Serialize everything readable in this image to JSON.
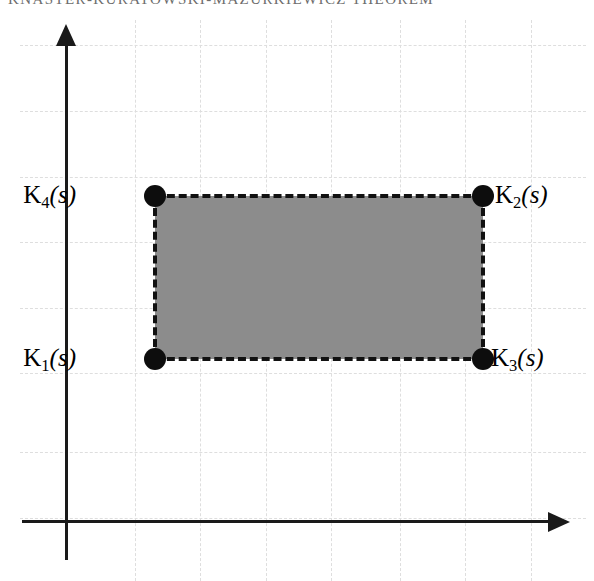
{
  "header": {
    "text": "KNASTER-KURATOWSKI-MAZURKIEWICZ THEOREM"
  },
  "figure": {
    "type": "math-diagram",
    "axes": {
      "x_axis_name": "x-axis",
      "y_axis_name": "y-axis",
      "origin_px": [
        66,
        521
      ],
      "x_arrow_direction": "right",
      "y_arrow_direction": "up",
      "tick_labels": []
    },
    "grid": {
      "visible": true,
      "style": "dashed",
      "color": "#dedede",
      "spacing_px": 65.5,
      "vertical_positions_px": [
        135,
        200,
        266,
        331,
        400,
        465,
        531
      ],
      "horizontal_positions_px": [
        45,
        111,
        177,
        242,
        308,
        373,
        452,
        518
      ]
    },
    "region": {
      "name": "shaded-rectangle",
      "fill_color": "#8c8c8c",
      "border_style": "dashed",
      "border_color": "#111111",
      "x_px": 155,
      "y_px": 196,
      "width_px": 328,
      "height_px": 163
    },
    "vertices": [
      {
        "id": "K1",
        "base": "K",
        "subscript": "1",
        "argument": "(s)",
        "corner": "bottom-left",
        "x_px": 155,
        "y_px": 359,
        "label_x_px": 76,
        "label_y_px": 345,
        "label_align": "right"
      },
      {
        "id": "K2",
        "base": "K",
        "subscript": "2",
        "argument": "(s)",
        "corner": "top-right",
        "x_px": 483,
        "y_px": 196,
        "label_x_px": 495,
        "label_y_px": 182,
        "label_align": "left"
      },
      {
        "id": "K3",
        "base": "K",
        "subscript": "3",
        "argument": "(s)",
        "corner": "bottom-right",
        "x_px": 483,
        "y_px": 359,
        "label_x_px": 491,
        "label_y_px": 345,
        "label_align": "left"
      },
      {
        "id": "K4",
        "base": "K",
        "subscript": "4",
        "argument": "(s)",
        "corner": "top-left",
        "x_px": 155,
        "y_px": 196,
        "label_x_px": 76,
        "label_y_px": 182,
        "label_align": "right"
      }
    ]
  }
}
